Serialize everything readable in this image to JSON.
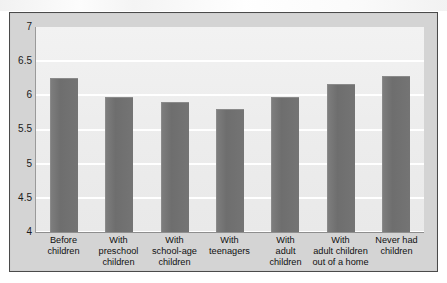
{
  "chart_data": {
    "type": "bar",
    "title": "",
    "subtitle": "",
    "xlabel": "",
    "ylabel": "",
    "ylim": [
      4,
      7
    ],
    "yticks": [
      "7",
      "6.5",
      "6",
      "5.5",
      "5",
      "4.5",
      "4"
    ],
    "ytick_values": [
      7,
      6.5,
      6,
      5.5,
      5,
      4.5,
      4
    ],
    "grid": true,
    "legend": false,
    "legend_position": "none",
    "bar_color": "#6e6e6e",
    "plot_background": "#efefef",
    "gridline_color": "#ffffff",
    "frame_color": "#4a4a4a",
    "categories": [
      "Before children",
      "With preschool children",
      "With school-age children",
      "With teenagers",
      "With adult children",
      "With adult children out of a home",
      "Never had children"
    ],
    "category_lines": [
      [
        "Before",
        "children"
      ],
      [
        "With",
        "preschool",
        "children"
      ],
      [
        "With",
        "school-age",
        "children"
      ],
      [
        "With",
        "teenagers"
      ],
      [
        "With",
        "adult",
        "children"
      ],
      [
        "With",
        "adult children",
        "out of a home"
      ],
      [
        "Never had",
        "children"
      ]
    ],
    "values": [
      6.25,
      5.97,
      5.9,
      5.8,
      5.97,
      6.17,
      6.28
    ]
  }
}
